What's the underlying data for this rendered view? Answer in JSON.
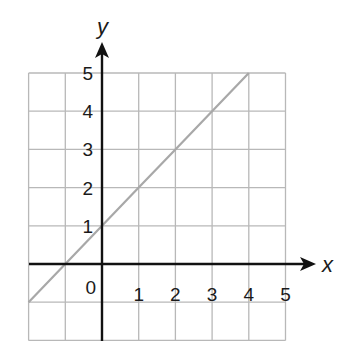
{
  "chart_data": {
    "type": "line",
    "title": "",
    "xlabel": "x",
    "ylabel": "y",
    "xlim": [
      -2,
      5
    ],
    "ylim": [
      -2,
      5
    ],
    "grid": true,
    "x_ticks": [
      "0",
      "1",
      "2",
      "3",
      "4",
      "5"
    ],
    "y_ticks": [
      "1",
      "2",
      "3",
      "4",
      "5"
    ],
    "series": [
      {
        "name": "y = x + 1",
        "x": [
          -2,
          -1,
          0,
          1,
          2,
          3,
          4
        ],
        "y": [
          -1,
          0,
          1,
          2,
          3,
          4,
          5
        ]
      }
    ],
    "colors": {
      "line": "#a8a8a8",
      "grid": "#b8b8b8",
      "axes": "#111111"
    }
  }
}
